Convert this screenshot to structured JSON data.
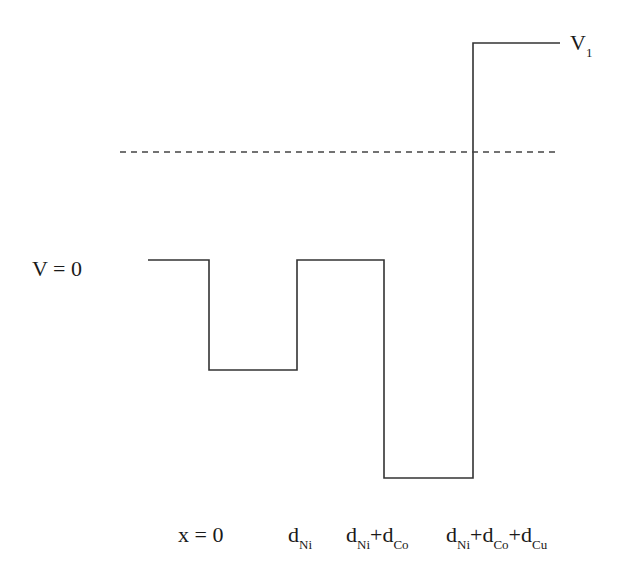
{
  "diagram": {
    "potential_profile": {
      "levels_description": [
        "V = 0 outside",
        "shallow well in Ni",
        "back to 0",
        "deep well in Co",
        "step up to V1 in Cu"
      ],
      "segments": [
        {
          "region": "x < 0",
          "level": "0"
        },
        {
          "region": "Ni",
          "level": "V_Ni (below 0)"
        },
        {
          "region": "Co interval 1",
          "level": "0"
        },
        {
          "region": "Co interval 2",
          "level": "deep well"
        },
        {
          "region": "beyond",
          "level": "V1"
        }
      ],
      "energy_line": "dashed"
    },
    "labels": {
      "v1_main": "V",
      "v1_sub": "1",
      "v0": "V = 0",
      "x0": "x = 0",
      "dni_main": "d",
      "dni_sub": "Ni",
      "dnico": [
        {
          "main": "d",
          "sub": "Ni"
        },
        {
          "main": "+d",
          "sub": "Co"
        }
      ],
      "dnicocu": [
        {
          "main": "d",
          "sub": "Ni"
        },
        {
          "main": "+d",
          "sub": "Co"
        },
        {
          "main": "+d",
          "sub": "Cu"
        }
      ]
    },
    "colors": {
      "line": "#333333",
      "dashed": "#444444"
    }
  }
}
